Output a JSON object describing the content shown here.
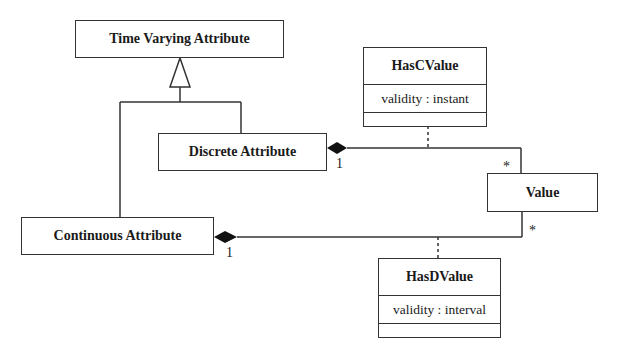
{
  "classes": {
    "time_varying": {
      "name": "Time Varying Attribute"
    },
    "discrete": {
      "name": "Discrete Attribute"
    },
    "continuous": {
      "name": "Continuous Attribute"
    },
    "value": {
      "name": "Value"
    },
    "has_c_value": {
      "name": "HasCValue",
      "attribute": "validity : instant"
    },
    "has_d_value": {
      "name": "HasDValue",
      "attribute": "validity : interval"
    }
  },
  "multiplicities": {
    "discrete_end": "1",
    "value_top_end": "*",
    "continuous_end": "1",
    "value_bottom_end": "*"
  },
  "colors": {
    "line": "#333333",
    "background": "#ffffff"
  }
}
